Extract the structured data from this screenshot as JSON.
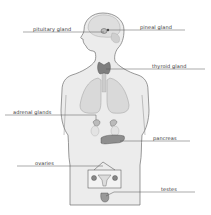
{
  "diagram": {
    "colors": {
      "background": "#ffffff",
      "body_fill": "#ececec",
      "body_stroke": "#6e6e6e",
      "organ_fill": "#d6d6d6",
      "gland_fill": "#8a8a8a",
      "leader_line": "#555555",
      "label_text": "#333333"
    },
    "labels": [
      {
        "id": "pituitary",
        "text": "pituitary gland",
        "x": 33,
        "y": 26
      },
      {
        "id": "pineal",
        "text": "pineal gland",
        "x": 140,
        "y": 24
      },
      {
        "id": "thyroid",
        "text": "thyroid gland",
        "x": 152,
        "y": 63
      },
      {
        "id": "adrenal",
        "text": "adrenal glands",
        "x": 13,
        "y": 109
      },
      {
        "id": "pancreas",
        "text": "pancreas",
        "x": 153,
        "y": 136
      },
      {
        "id": "ovaries",
        "text": "ovaries",
        "x": 35,
        "y": 160
      },
      {
        "id": "testes",
        "text": "testes",
        "x": 161,
        "y": 187
      }
    ]
  }
}
